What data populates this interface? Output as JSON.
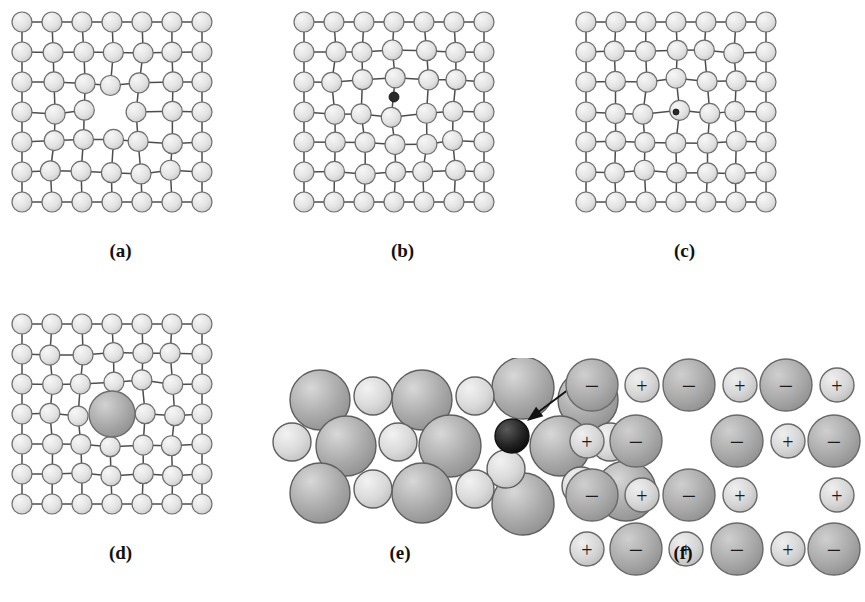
{
  "figure": {
    "bottom_caption": "",
    "background": "#ffffff",
    "colors": {
      "atom_fill_light": "#e3e3e3",
      "atom_fill_light_highlight": "#f7f7f7",
      "atom_stroke": "#6e6e6e",
      "bond_stroke": "#4d4d4d",
      "impurity_large_fill": "#a8a8a8",
      "impurity_large_highlight": "#d2d2d2",
      "impurity_dark_fill": "#2a2a2a",
      "sphere_large_fill": "#a9a9a9",
      "sphere_large_highlight": "#d8d8d8",
      "sphere_small_fill": "#d9d9d9",
      "sphere_small_highlight": "#f2f2f2",
      "sphere_dark_fill": "#232323",
      "arrow_stroke": "#111111",
      "ion_text": "#1b1b1b",
      "label_text": "#111111"
    }
  },
  "panels": [
    {
      "id": "a",
      "label": "(a)",
      "defect_type": "vacancy",
      "description": "Vacancy: one lattice atom missing from the centre of the array; neighbouring atoms relax toward the empty site.",
      "lattice": {
        "rows": 7,
        "cols": 7,
        "spacing": 30,
        "atom_radius": 10
      },
      "missing_sites": [
        [
          3,
          3
        ]
      ],
      "extra_particles": []
    },
    {
      "id": "b",
      "label": "(b)",
      "defect_type": "self-interstitial",
      "description": "Self-interstitial: an atom crowded into an interstitial site, distorting the surrounding lattice.",
      "lattice": {
        "rows": 7,
        "cols": 7,
        "spacing": 30,
        "atom_radius": 10
      },
      "missing_sites": [],
      "extra_particles": [
        {
          "kind": "interstitial-dot",
          "row": 2.5,
          "col": 3.0,
          "radius": 5,
          "fill": "#2a2a2a"
        }
      ]
    },
    {
      "id": "c",
      "label": "(c)",
      "defect_type": "interstitial-impurity",
      "description": "Interstitial impurity atom: a very small foreign atom squeezed into an interstitial position between host atoms.",
      "lattice": {
        "rows": 7,
        "cols": 7,
        "spacing": 30,
        "atom_radius": 10
      },
      "missing_sites": [],
      "extra_particles": [
        {
          "kind": "interstitial-dot",
          "row": 3.0,
          "col": 3.0,
          "radius": 3,
          "fill": "#2a2a2a"
        }
      ]
    },
    {
      "id": "d",
      "label": "(d)",
      "defect_type": "substitutional-impurity",
      "description": "Substitutional impurity atom: a large foreign atom occupying a regular lattice site, straining the lattice.",
      "lattice": {
        "rows": 7,
        "cols": 7,
        "spacing": 30,
        "atom_radius": 10
      },
      "missing_sites": [
        [
          3,
          3
        ]
      ],
      "extra_particles": [
        {
          "kind": "substitutional-large",
          "row": 3.0,
          "col": 3.0,
          "radius": 23,
          "fill": "#a8a8a8"
        }
      ]
    },
    {
      "id": "e",
      "label": "(e)",
      "defect_type": "close-packed-interstitial",
      "description": "Close-packed hard-sphere model of two atom sizes with a small dark interstitial atom marked by an arrow.",
      "spheres": [
        {
          "cx": 50,
          "cy": 42,
          "r": 30,
          "type": "large"
        },
        {
          "cx": 103,
          "cy": 38,
          "r": 19,
          "type": "small"
        },
        {
          "cx": 152,
          "cy": 42,
          "r": 30,
          "type": "large"
        },
        {
          "cx": 205,
          "cy": 38,
          "r": 19,
          "type": "small"
        },
        {
          "cx": 253,
          "cy": 30,
          "r": 31,
          "type": "large"
        },
        {
          "cx": 318,
          "cy": 42,
          "r": 30,
          "type": "large"
        },
        {
          "cx": 22,
          "cy": 84,
          "r": 19,
          "type": "small"
        },
        {
          "cx": 76,
          "cy": 88,
          "r": 30,
          "type": "large"
        },
        {
          "cx": 128,
          "cy": 84,
          "r": 19,
          "type": "small"
        },
        {
          "cx": 180,
          "cy": 88,
          "r": 31,
          "type": "large"
        },
        {
          "cx": 242,
          "cy": 78,
          "r": 17,
          "type": "dark"
        },
        {
          "cx": 236,
          "cy": 111,
          "r": 19,
          "type": "small"
        },
        {
          "cx": 290,
          "cy": 88,
          "r": 30,
          "type": "large"
        },
        {
          "cx": 340,
          "cy": 84,
          "r": 19,
          "type": "small"
        },
        {
          "cx": 50,
          "cy": 135,
          "r": 30,
          "type": "large"
        },
        {
          "cx": 103,
          "cy": 131,
          "r": 19,
          "type": "small"
        },
        {
          "cx": 152,
          "cy": 135,
          "r": 30,
          "type": "large"
        },
        {
          "cx": 205,
          "cy": 131,
          "r": 19,
          "type": "small"
        },
        {
          "cx": 253,
          "cy": 146,
          "r": 31,
          "type": "large"
        },
        {
          "cx": 311,
          "cy": 128,
          "r": 19,
          "type": "small"
        },
        {
          "cx": 356,
          "cy": 133,
          "r": 30,
          "type": "large"
        }
      ],
      "arrow": {
        "x1": 330,
        "y1": 8,
        "x2": 257,
        "y2": 63
      }
    },
    {
      "id": "f",
      "label": "(f)",
      "defect_type": "schottky-pair",
      "description": "Ionic crystal with a cation vacancy and an anion vacancy (Schottky defect); large circles are anions marked minus, small circles are cations marked plus.",
      "ion_rows": [
        {
          "y": 27,
          "ions": [
            {
              "x": 34,
              "charge": "−",
              "r": 26,
              "kind": "anion"
            },
            {
              "x": 84,
              "charge": "+",
              "r": 17,
              "kind": "cation"
            },
            {
              "x": 131,
              "charge": "−",
              "r": 26,
              "kind": "anion"
            },
            {
              "x": 182,
              "charge": "+",
              "r": 17,
              "kind": "cation"
            },
            {
              "x": 228,
              "charge": "−",
              "r": 26,
              "kind": "anion"
            },
            {
              "x": 279,
              "charge": "+",
              "r": 17,
              "kind": "cation"
            }
          ]
        },
        {
          "y": 83,
          "ions": [
            {
              "x": 29,
              "charge": "+",
              "r": 17,
              "kind": "cation"
            },
            {
              "x": 78,
              "charge": "−",
              "r": 26,
              "kind": "anion"
            },
            {
              "x": 179,
              "charge": "−",
              "r": 26,
              "kind": "anion"
            },
            {
              "x": 230,
              "charge": "+",
              "r": 17,
              "kind": "cation"
            },
            {
              "x": 276,
              "charge": "−",
              "r": 26,
              "kind": "anion"
            }
          ]
        },
        {
          "y": 137,
          "ions": [
            {
              "x": 34,
              "charge": "−",
              "r": 26,
              "kind": "anion"
            },
            {
              "x": 84,
              "charge": "+",
              "r": 17,
              "kind": "cation"
            },
            {
              "x": 131,
              "charge": "−",
              "r": 26,
              "kind": "anion"
            },
            {
              "x": 182,
              "charge": "+",
              "r": 17,
              "kind": "cation"
            },
            {
              "x": 279,
              "charge": "+",
              "r": 17,
              "kind": "cation"
            }
          ]
        },
        {
          "y": 191,
          "ions": [
            {
              "x": 29,
              "charge": "+",
              "r": 17,
              "kind": "cation"
            },
            {
              "x": 78,
              "charge": "−",
              "r": 26,
              "kind": "anion"
            },
            {
              "x": 128,
              "charge": "+",
              "r": 17,
              "kind": "cation"
            },
            {
              "x": 179,
              "charge": "−",
              "r": 26,
              "kind": "anion"
            },
            {
              "x": 230,
              "charge": "+",
              "r": 17,
              "kind": "cation"
            },
            {
              "x": 276,
              "charge": "−",
              "r": 26,
              "kind": "anion"
            }
          ]
        }
      ],
      "vacancies": [
        {
          "row": 2,
          "position": 3,
          "missing": "+"
        },
        {
          "row": 3,
          "position": 5,
          "missing": "−"
        }
      ]
    }
  ]
}
